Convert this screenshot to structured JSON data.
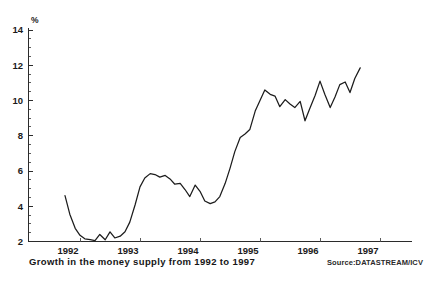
{
  "caption": {
    "title": "Growth in the money supply from 1992 to 1997",
    "source": "Source:DATASTREAM/ICV"
  },
  "axes": {
    "unit_symbol": "%",
    "y_ticks": [
      "14",
      "12",
      "10",
      "8",
      "6",
      "4",
      "2"
    ],
    "x_ticks": [
      "1992",
      "1993",
      "1994",
      "1995",
      "1996",
      "1997"
    ]
  },
  "chart_data": {
    "type": "line",
    "title": "Growth in the money supply from 1992 to 1997",
    "subtitle": "",
    "xlabel": "",
    "ylabel": "%",
    "ylim": [
      2,
      14
    ],
    "xlim": [
      1992.0,
      1997.4
    ],
    "ytick_values": [
      2,
      4,
      6,
      8,
      10,
      12,
      14
    ],
    "xtick_values": [
      1992,
      1993,
      1994,
      1995,
      1996,
      1997
    ],
    "grid": false,
    "legend": "none",
    "series": [
      {
        "name": "Money supply growth",
        "color": "#1c1c1c",
        "x": [
          1992.25,
          1992.33,
          1992.42,
          1992.5,
          1992.58,
          1992.67,
          1992.75,
          1992.83,
          1992.92,
          1993.0,
          1993.08,
          1993.17,
          1993.25,
          1993.33,
          1993.42,
          1993.5,
          1993.58,
          1993.67,
          1993.75,
          1993.83,
          1993.92,
          1994.0,
          1994.08,
          1994.17,
          1994.25,
          1994.33,
          1994.42,
          1994.5,
          1994.58,
          1994.67,
          1994.75,
          1994.83,
          1994.92,
          1995.0,
          1995.08,
          1995.17,
          1995.25,
          1995.33,
          1995.42,
          1995.5,
          1995.58,
          1995.67,
          1995.75,
          1995.83,
          1995.92,
          1996.0,
          1996.08,
          1996.17,
          1996.25,
          1996.33,
          1996.42,
          1996.5,
          1996.58,
          1996.67,
          1996.75,
          1996.83,
          1996.92,
          1997.0,
          1997.08,
          1997.17
        ],
        "y": [
          4.6,
          3.55,
          2.75,
          2.35,
          2.15,
          2.1,
          2.05,
          2.4,
          2.1,
          2.55,
          2.2,
          2.3,
          2.55,
          3.1,
          4.1,
          5.1,
          5.6,
          5.85,
          5.8,
          5.65,
          5.75,
          5.55,
          5.25,
          5.3,
          4.95,
          4.55,
          5.2,
          4.85,
          4.3,
          4.15,
          4.25,
          4.55,
          5.3,
          6.15,
          7.1,
          7.9,
          8.1,
          8.35,
          9.4,
          10.0,
          10.6,
          10.35,
          10.25,
          9.65,
          10.05,
          9.8,
          9.6,
          9.95,
          8.85,
          9.55,
          10.3,
          11.1,
          10.35,
          9.6,
          10.2,
          10.9,
          11.05,
          10.45,
          11.25,
          11.85
        ]
      }
    ]
  }
}
